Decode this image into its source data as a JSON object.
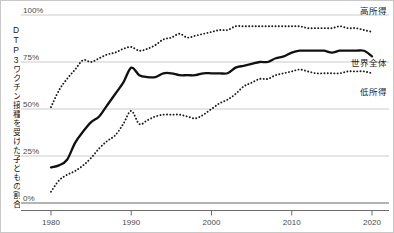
{
  "chart_data": {
    "type": "line",
    "title": "",
    "subtitle": "",
    "xlabel": "",
    "ylabel": "DTP3ワクチン接種を受けた子どもの割合",
    "xlim": [
      1980,
      2020
    ],
    "ylim": [
      0,
      100
    ],
    "grid": true,
    "legend_position": "right-inline",
    "y_ticks": [
      "0%",
      "25%",
      "50%",
      "75%",
      "100%"
    ],
    "y_tick_values": [
      0,
      25,
      50,
      75,
      100
    ],
    "x_ticks": [
      "1980",
      "1990",
      "2000",
      "2010",
      "2020"
    ],
    "x_tick_values": [
      1980,
      1990,
      2000,
      2010,
      2020
    ],
    "x": [
      1980,
      1981,
      1982,
      1983,
      1984,
      1985,
      1986,
      1987,
      1988,
      1989,
      1990,
      1991,
      1992,
      1993,
      1994,
      1995,
      1996,
      1997,
      1998,
      1999,
      2000,
      2001,
      2002,
      2003,
      2004,
      2005,
      2006,
      2007,
      2008,
      2009,
      2010,
      2011,
      2012,
      2013,
      2014,
      2015,
      2016,
      2017,
      2018,
      2019,
      2020
    ],
    "series": [
      {
        "name": "高所得",
        "style": "dotted",
        "color": "#1a1a1a",
        "values": [
          51,
          60,
          66,
          71,
          76,
          75,
          77,
          79,
          80,
          82,
          83,
          81,
          82,
          84,
          87,
          88,
          90,
          88,
          89,
          90,
          91,
          92,
          92,
          94,
          94,
          94,
          94,
          94,
          94,
          94,
          94,
          94,
          93,
          93,
          93,
          93,
          94,
          93,
          93,
          92,
          91
        ]
      },
      {
        "name": "世界全体",
        "style": "solid",
        "color": "#111111",
        "values": [
          19,
          20,
          23,
          32,
          38,
          43,
          46,
          52,
          58,
          64,
          72,
          68,
          67,
          67,
          69,
          69,
          68,
          68,
          68,
          69,
          69,
          69,
          69,
          72,
          73,
          74,
          75,
          75,
          77,
          78,
          80,
          81,
          81,
          81,
          81,
          80,
          81,
          81,
          81,
          81,
          78
        ]
      },
      {
        "name": "低所得",
        "style": "dotted",
        "color": "#1a1a1a",
        "values": [
          6,
          12,
          15,
          17,
          20,
          24,
          29,
          33,
          36,
          42,
          49,
          42,
          44,
          46,
          47,
          47,
          47,
          46,
          45,
          47,
          50,
          53,
          55,
          58,
          62,
          64,
          66,
          66,
          68,
          69,
          70,
          71,
          70,
          69,
          69,
          69,
          69,
          70,
          70,
          70,
          69
        ]
      }
    ],
    "annotations": []
  },
  "axis": {
    "y_label_text": "DTP3ワクチン接種を受けた子どもの割合"
  },
  "labels": {
    "high_income": "高所得",
    "world_total": "世界全体",
    "low_income": "低所得"
  },
  "colors": {
    "gridline": "#c4c4c4",
    "axis": "#6b6b6b",
    "series_solid": "#111111",
    "series_dotted": "#1a1a1a",
    "text": "#1a1a1a",
    "tick_text": "#4a4a4a",
    "background": "#ffffff"
  }
}
